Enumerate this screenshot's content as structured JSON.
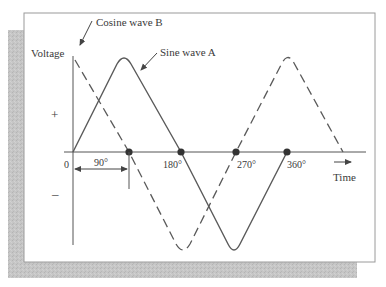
{
  "diagram": {
    "labels": {
      "y_axis": "Voltage",
      "x_axis": "Time",
      "plus": "+",
      "minus": "–",
      "origin": "0",
      "phase_shift": "90°",
      "tick_180": "180°",
      "tick_270": "270°",
      "tick_360": "360°",
      "cosine": "Cosine wave B",
      "sine": "Sine wave A"
    },
    "series": [
      {
        "name": "Sine wave A",
        "style": "solid",
        "color": "#5a5a5a",
        "starts_at_deg": 0
      },
      {
        "name": "Cosine wave B",
        "style": "dashed",
        "color": "#5a5a5a",
        "starts_at_deg": -90
      }
    ],
    "zero_crossings_deg": [
      90,
      180,
      270,
      360
    ],
    "phase_difference_deg": 90,
    "colors": {
      "frame_border": "#9a9a9a",
      "shadow": "#c4c4c4",
      "ink": "#555555"
    }
  }
}
